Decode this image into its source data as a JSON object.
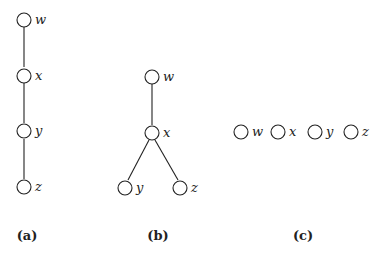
{
  "figure": {
    "panels": [
      {
        "caption": "(a)",
        "structure": "chain",
        "nodes": [
          "w",
          "x",
          "y",
          "z"
        ],
        "edges": [
          [
            "w",
            "x"
          ],
          [
            "x",
            "y"
          ],
          [
            "y",
            "z"
          ]
        ]
      },
      {
        "caption": "(b)",
        "structure": "tree",
        "nodes": [
          "w",
          "x",
          "y",
          "z"
        ],
        "edges": [
          [
            "w",
            "x"
          ],
          [
            "x",
            "y"
          ],
          [
            "x",
            "z"
          ]
        ]
      },
      {
        "caption": "(c)",
        "structure": "independent",
        "nodes": [
          "w",
          "x",
          "y",
          "z"
        ],
        "edges": []
      }
    ]
  },
  "colors": {
    "stroke": "#222222",
    "background": "#ffffff"
  }
}
